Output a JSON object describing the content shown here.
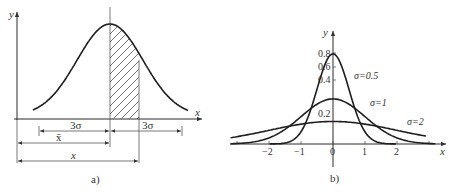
{
  "panel_a": {
    "caption": "a)",
    "y_axis_label": "y",
    "x_axis_label": "x",
    "dim_left_label": "3σ",
    "dim_right_label": "3σ",
    "mean_label": "x̄",
    "x_label": "x",
    "hatched_region": "from mean to mean + 1 (partial area under curve)"
  },
  "panel_b": {
    "caption": "b)",
    "y_axis_label": "y",
    "x_axis_label": "x",
    "y_ticks": [
      "0.8",
      "0.6",
      "0.4",
      "0.2"
    ],
    "x_ticks": [
      "−2",
      "−1",
      "0",
      "1",
      "2"
    ],
    "x_tick_values": [
      -2,
      -1,
      0,
      1,
      2
    ],
    "curves": [
      {
        "label": "σ=0.5",
        "sigma": 0.5
      },
      {
        "label": "σ=1",
        "sigma": 1
      },
      {
        "label": "σ=2",
        "sigma": 2
      }
    ]
  }
}
